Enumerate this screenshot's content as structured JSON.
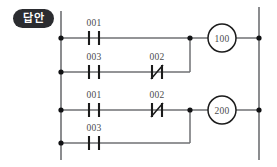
{
  "badge": {
    "label": "답안"
  },
  "diagram": {
    "type": "plc-ladder-diagram",
    "title": "",
    "left_rail_label": "",
    "right_rail_label": ""
  },
  "rungs": [
    {
      "id": "rung-1",
      "output": "100",
      "branches": [
        {
          "id": "rung-1-branch-1",
          "contacts": [
            {
              "address": "001",
              "type": "normally-open"
            }
          ]
        },
        {
          "id": "rung-1-branch-2",
          "contacts": [
            {
              "address": "003",
              "type": "normally-open"
            },
            {
              "address": "002",
              "type": "normally-closed"
            }
          ]
        }
      ]
    },
    {
      "id": "rung-2",
      "output": "200",
      "branches": [
        {
          "id": "rung-2-branch-1",
          "contacts": [
            {
              "address": "001",
              "type": "normally-open"
            },
            {
              "address": "002",
              "type": "normally-closed"
            }
          ]
        },
        {
          "id": "rung-2-branch-2",
          "contacts": [
            {
              "address": "003",
              "type": "normally-open"
            }
          ]
        }
      ]
    }
  ],
  "labels": {
    "r1b1_c1": "001",
    "r1b2_c1": "003",
    "r1b2_c2": "002",
    "r2b1_c1": "001",
    "r2b1_c2": "002",
    "r2b2_c1": "003",
    "coil_1": "100",
    "coil_2": "200"
  },
  "colors": {
    "wire": "#6f7073",
    "symbol": "#1b1b1b",
    "node": "#111214",
    "text": "#4a4b4e",
    "badge_bg": "#2b2c30",
    "badge_text": "#ffffff",
    "background": "#ffffff"
  }
}
